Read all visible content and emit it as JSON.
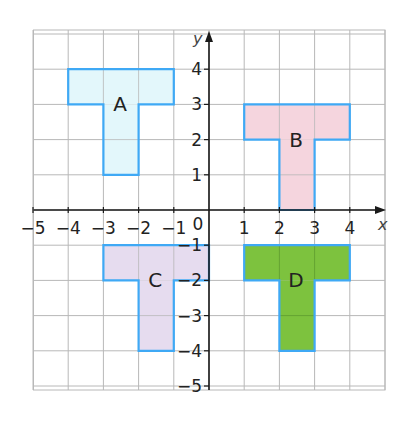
{
  "diagram": {
    "type": "coordinate-grid",
    "axes": {
      "x_label": "x",
      "y_label": "y",
      "x_ticks": [
        "−5",
        "−4",
        "−3",
        "−2",
        "−1",
        "0",
        "1",
        "2",
        "3",
        "4"
      ],
      "y_ticks": [
        "4",
        "3",
        "2",
        "1",
        "−1",
        "−2",
        "−3",
        "−4",
        "−5"
      ],
      "x_range": [
        -5,
        5
      ],
      "y_range": [
        -5,
        5
      ]
    },
    "colors": {
      "grid": "#b8b8b8",
      "axis": "#1a1a1a",
      "outline": "#3fa9f5",
      "label_text": "#222222"
    },
    "shapes": [
      {
        "label": "A",
        "fill": "#e3f7fb",
        "rects": [
          [
            -4,
            3,
            3,
            1
          ],
          [
            -3,
            1,
            1,
            2
          ]
        ],
        "label_pos": [
          -2.5,
          3
        ]
      },
      {
        "label": "B",
        "fill": "#f5d5de",
        "rects": [
          [
            1,
            2,
            3,
            1
          ],
          [
            2,
            0,
            1,
            2
          ]
        ],
        "label_pos": [
          2.5,
          2
        ]
      },
      {
        "label": "C",
        "fill": "#e6dcef",
        "rects": [
          [
            -3,
            -2,
            3,
            1
          ],
          [
            -2,
            -4,
            1,
            2
          ]
        ],
        "label_pos": [
          -1.5,
          -2
        ]
      },
      {
        "label": "D",
        "fill": "#7dc23e",
        "rects": [
          [
            1,
            -2,
            3,
            1
          ],
          [
            2,
            -4,
            1,
            2
          ]
        ],
        "label_pos": [
          2.5,
          -2
        ]
      }
    ]
  }
}
